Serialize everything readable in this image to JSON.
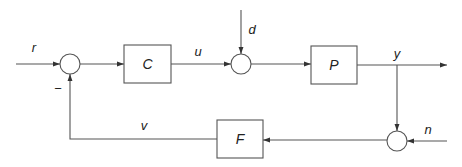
{
  "diagram": {
    "type": "feedback-control-block-diagram",
    "blocks": [
      {
        "id": "C",
        "label": "C",
        "role": "controller"
      },
      {
        "id": "P",
        "label": "P",
        "role": "plant"
      },
      {
        "id": "F",
        "label": "F",
        "role": "feedback filter"
      }
    ],
    "summing_junctions": [
      {
        "id": "sum1",
        "inputs": [
          "r",
          "v (negative)"
        ]
      },
      {
        "id": "sum2",
        "inputs": [
          "u",
          "d"
        ]
      },
      {
        "id": "sum3",
        "inputs": [
          "y",
          "n"
        ]
      }
    ],
    "signals": {
      "r": "r",
      "u": "u",
      "d": "d",
      "y": "y",
      "n": "n",
      "v": "v"
    },
    "minus_sign": "−",
    "colors": {
      "line": "#555555",
      "text": "#222222",
      "background": "#ffffff"
    }
  }
}
